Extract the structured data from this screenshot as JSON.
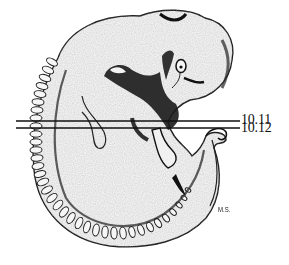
{
  "figure": {
    "section_lines": [
      {
        "label": "10.11",
        "y": 121
      },
      {
        "label": "10.12",
        "y": 128
      }
    ],
    "artist_initials": "M.S.",
    "colors": {
      "background": "#ffffff",
      "body_fill": "#f1f1f1",
      "outline": "#1a1a1a",
      "shadow": "#2a2a2a"
    }
  }
}
